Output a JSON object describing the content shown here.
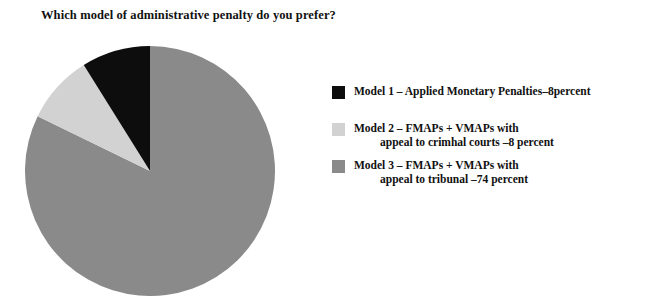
{
  "chart_title": "Which model of administrative penalty do you prefer?",
  "chart_data": {
    "type": "pie",
    "title": "Which model of administrative penalty do you prefer?",
    "subtitle": "",
    "xlabel": "",
    "ylabel": "",
    "legend_position": "right",
    "grid": false,
    "unit": "percent",
    "categories": [
      "Model 1 - Applied Monetary Penalties",
      "Model 2 - FMAPs + VMAPs with appeal to criminal courts",
      "Model 3 - FMAPs + VMAPs with appeal to tribunal"
    ],
    "values": [
      8,
      8,
      74
    ],
    "colors": [
      "#0d0d0d",
      "#d2d2d2",
      "#8a8a8a"
    ],
    "slice_order_clockwise_from_12": [
      "Model 3",
      "Model 2",
      "Model 1"
    ],
    "start_angle_deg": 0,
    "center": {
      "x": 150,
      "y": 171
    },
    "radius": 125
  },
  "legend": {
    "entries": [
      {
        "swatch_color": "#0d0d0d",
        "swatch_name": "model-1-swatch",
        "line1": "Model 1 –  Applied Monetary Penalties–8percent",
        "line2": ""
      },
      {
        "swatch_color": "#d2d2d2",
        "swatch_name": "model-2-swatch",
        "line1": "Model 2 –  FMAPs + VMAPs with",
        "line2": "appeal to crimhal courts –8 percent"
      },
      {
        "swatch_color": "#8a8a8a",
        "swatch_name": "model-3-swatch",
        "line1": "Model 3 –  FMAPs + VMAPs with",
        "line2": "appeal to tribunal –74 percent"
      }
    ]
  }
}
